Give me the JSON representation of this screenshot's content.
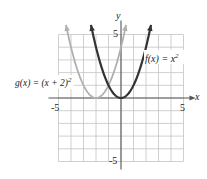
{
  "chart_data": {
    "type": "line",
    "title": "",
    "xlabel": "x",
    "ylabel": "y",
    "xlim": [
      -5,
      5
    ],
    "ylim": [
      -5,
      5
    ],
    "grid": true,
    "x_ticks_labeled": [
      "-5",
      "5"
    ],
    "y_ticks_labeled": [
      "5",
      "-5"
    ],
    "series": [
      {
        "name": "f(x) = x^2",
        "label_main": "f(x) = x",
        "label_exp": "2",
        "formula": "x^2",
        "color": "#333333",
        "x": [
          -2.4,
          -2,
          -1,
          0,
          1,
          2,
          2.4
        ],
        "y": [
          5.76,
          4,
          1,
          0,
          1,
          4,
          5.76
        ]
      },
      {
        "name": "g(x) = (x + 2)^2",
        "label_main": "g(x) = (x + 2)",
        "label_exp": "2",
        "formula": "(x+2)^2",
        "color": "#b0b0b0",
        "x": [
          -4.4,
          -4,
          -3,
          -2,
          -1,
          0,
          0.4
        ],
        "y": [
          5.76,
          4,
          1,
          0,
          1,
          4,
          5.76
        ]
      }
    ]
  }
}
